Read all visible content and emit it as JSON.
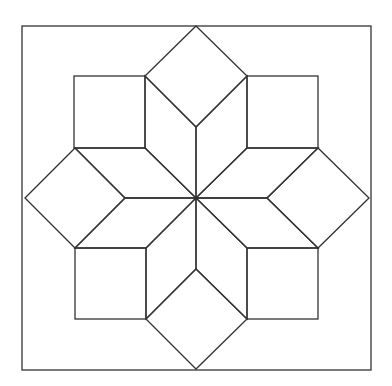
{
  "diagram": {
    "title": "",
    "components": {
      "frame": "outer square border",
      "star": "eight rhombus points radiating from the center",
      "corner_squares": "four squares set in the corners between star points",
      "side_diamonds": "four diamonds (squares rotated 45 degrees) on each side between star points"
    },
    "counts": {
      "rhombi": 8,
      "corner_squares": 4,
      "side_diamonds": 4
    },
    "colors": {
      "line": "#333333",
      "background": "#ffffff"
    }
  }
}
